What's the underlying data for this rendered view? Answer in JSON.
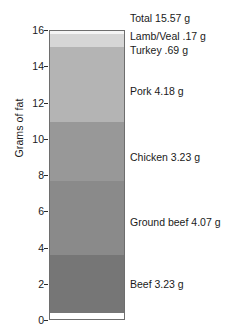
{
  "chart_data": {
    "type": "bar",
    "subtype": "stacked-bar-single-column",
    "title": "",
    "xlabel": "",
    "ylabel": "Grams of fat",
    "ylim": [
      0,
      16
    ],
    "yticks": [
      0,
      2,
      4,
      6,
      8,
      10,
      12,
      14,
      16
    ],
    "ytick_labels": [
      "0",
      "2",
      "4",
      "6",
      "8",
      "10",
      "12",
      "14",
      "16"
    ],
    "grid": false,
    "legend": "right-side direct labels",
    "total": 15.57,
    "total_label": "Total 15.57 g",
    "units": "g",
    "categories": [
      "Beef",
      "Ground beef",
      "Chicken",
      "Pork",
      "Turkey",
      "Lamb/Veal"
    ],
    "values": [
      3.23,
      4.07,
      3.23,
      4.18,
      0.69,
      0.17
    ],
    "segments": [
      {
        "name": "Beef",
        "value": 3.23,
        "label": "Beef 3.23 g",
        "color": "#767676",
        "label_top": 278
      },
      {
        "name": "Ground beef",
        "value": 4.07,
        "label": "Ground beef 4.07 g",
        "color": "#8a8a8a",
        "label_top": 216
      },
      {
        "name": "Chicken",
        "value": 3.23,
        "label": "Chicken 3.23 g",
        "color": "#989898",
        "label_top": 151
      },
      {
        "name": "Pork",
        "value": 4.18,
        "label": "Pork 4.18 g",
        "color": "#b4b4b4",
        "label_top": 85
      },
      {
        "name": "Turkey",
        "value": 0.69,
        "label": "Turkey .69 g",
        "color": "#d6d6d6",
        "label_top": 44
      },
      {
        "name": "Lamb/Veal",
        "value": 0.17,
        "label": "Lamb/Veal .17 g",
        "color": "#f4f4f4",
        "label_top": 30
      }
    ]
  }
}
